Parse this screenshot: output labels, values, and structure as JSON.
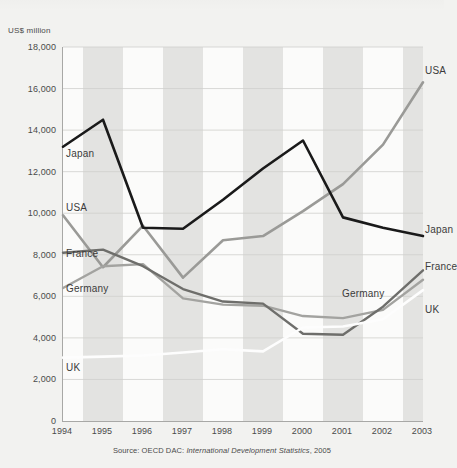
{
  "chart_data": {
    "type": "line",
    "title": "",
    "xlabel": "",
    "ylabel": "US$ million",
    "categories": [
      1994,
      1995,
      1996,
      1997,
      1998,
      1999,
      2000,
      2001,
      2002,
      2003
    ],
    "xlim": [
      1994,
      2003
    ],
    "ylim": [
      0,
      18000
    ],
    "ytick_step": 2000,
    "yticks": [
      "18,000",
      "16,000",
      "14,000",
      "12,000",
      "10,000",
      "8,000",
      "6,000",
      "4,000",
      "2,000",
      "0"
    ],
    "ytick_values": [
      18000,
      16000,
      14000,
      12000,
      10000,
      8000,
      6000,
      4000,
      2000,
      0
    ],
    "xticks": [
      "1994",
      "1995",
      "1996",
      "1997",
      "1998",
      "1999",
      "2000",
      "2001",
      "2002",
      "2003"
    ],
    "grid": "horizontal-gridlines-with-alternating-vertical-bands",
    "legend_position": "inline-end-labels",
    "series": [
      {
        "name": "Japan",
        "color": "#1a1a1a",
        "width": 2.6,
        "values": [
          13200,
          14500,
          9300,
          9250,
          10650,
          12150,
          13500,
          9800,
          9300,
          8900
        ],
        "label_left_y": 12900,
        "label_right_y": 9250
      },
      {
        "name": "USA",
        "color": "#9a9a97",
        "width": 2.6,
        "values": [
          9900,
          7400,
          9400,
          6900,
          8700,
          8900,
          10100,
          11400,
          13300,
          16300
        ],
        "label_left_y": 10300,
        "label_right_y": 16900
      },
      {
        "name": "France",
        "color": "#6e6e6b",
        "width": 2.4,
        "values": [
          8100,
          8250,
          7450,
          6350,
          5750,
          5650,
          4200,
          4150,
          5500,
          7250
        ],
        "label_left_y": 8100,
        "label_right_y": 7450
      },
      {
        "name": "Germany",
        "color": "#a3a3a0",
        "width": 2.4,
        "values": [
          6400,
          7450,
          7550,
          5900,
          5600,
          5550,
          5050,
          4950,
          5350,
          6800
        ],
        "label_left_y": 6400,
        "label_right_y": 6150
      },
      {
        "name": "UK",
        "color": "#fdfdfd",
        "width": 2.6,
        "values": [
          3050,
          3100,
          3150,
          3300,
          3450,
          3350,
          4500,
          4550,
          4900,
          6300
        ],
        "label_left_y": 2600,
        "label_right_y": 5400
      }
    ],
    "annotations": {
      "source": "Source: OECD DAC: International Development Statistics, 2005",
      "source_prefix": "Source: OECD DAC: ",
      "source_italic": "International Development Statistics",
      "source_suffix": ", 2005"
    }
  }
}
